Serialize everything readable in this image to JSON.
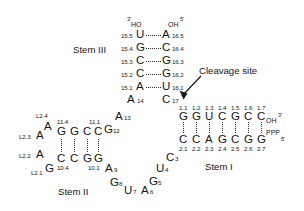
{
  "figure": {
    "type": "rna-secondary-structure",
    "stem_labels": {
      "stem1": "Stem I",
      "stem2": "Stem II",
      "stem3": "Stem III"
    },
    "annotations": {
      "cleavage_site": "Cleavage site"
    },
    "termini": {
      "stem3_left_prime": "3'",
      "stem3_left_group": "HO",
      "stem3_right_group": "OH",
      "stem3_right_prime": "5'",
      "stem1_top_group": "OH",
      "stem1_top_prime": "3'",
      "stem1_bottom_group": "PPP",
      "stem1_bottom_prime": "5'"
    },
    "stem3": {
      "left_strand": [
        {
          "base": "U",
          "number": "15.5"
        },
        {
          "base": "G",
          "number": "15.4"
        },
        {
          "base": "C",
          "number": "15.3"
        },
        {
          "base": "C",
          "number": "15.2"
        },
        {
          "base": "A",
          "number": "15.1"
        }
      ],
      "right_strand": [
        {
          "base": "A",
          "number": "16.5"
        },
        {
          "base": "C",
          "number": "16.4"
        },
        {
          "base": "G",
          "number": "16.3"
        },
        {
          "base": "G",
          "number": "16.2"
        },
        {
          "base": "U",
          "number": "16.1"
        }
      ]
    },
    "stem1": {
      "top_strand": [
        {
          "base": "G",
          "number": "1.1"
        },
        {
          "base": "G",
          "number": "1.2"
        },
        {
          "base": "U",
          "number": "1.3"
        },
        {
          "base": "C",
          "number": "1.4"
        },
        {
          "base": "G",
          "number": "1.5"
        },
        {
          "base": "C",
          "number": "1.6"
        },
        {
          "base": "C",
          "number": "1.7"
        }
      ],
      "bottom_strand": [
        {
          "base": "C",
          "number": "2.1"
        },
        {
          "base": "C",
          "number": "2.2"
        },
        {
          "base": "A",
          "number": "2.3"
        },
        {
          "base": "G",
          "number": "2.4"
        },
        {
          "base": "C",
          "number": "2.5"
        },
        {
          "base": "G",
          "number": "2.6"
        },
        {
          "base": "G",
          "number": "2.7"
        }
      ]
    },
    "stem2": {
      "top_strand": [
        {
          "base": "G",
          "number": "11.4"
        },
        {
          "base": "G",
          "number": ""
        },
        {
          "base": "C",
          "number": ""
        },
        {
          "base": "C",
          "number": "11.1"
        }
      ],
      "bottom_strand": [
        {
          "base": "C",
          "number": "10.4"
        },
        {
          "base": "C",
          "number": ""
        },
        {
          "base": "G",
          "number": ""
        },
        {
          "base": "G",
          "number": "10.1"
        }
      ]
    },
    "loop2": [
      {
        "base": "A",
        "number": "L2.4"
      },
      {
        "base": "A",
        "number": "L2.3"
      },
      {
        "base": "A",
        "number": "L2.2"
      },
      {
        "base": "G",
        "number": "L2.1"
      }
    ],
    "core_bases": [
      {
        "base": "A",
        "number": "14"
      },
      {
        "base": "C",
        "number": "17"
      },
      {
        "base": "A",
        "number": "13"
      },
      {
        "base": "G",
        "number": "12"
      },
      {
        "base": "A",
        "number": "9"
      },
      {
        "base": "G",
        "number": "8"
      },
      {
        "base": "U",
        "number": "7"
      },
      {
        "base": "A",
        "number": "6"
      },
      {
        "base": "G",
        "number": "5"
      },
      {
        "base": "U",
        "number": "4"
      },
      {
        "base": "C",
        "number": "3"
      }
    ],
    "colors": {
      "base_text": "#141414",
      "number_text": "#1c1c1c",
      "hbond": "#2a2a2a",
      "background": "#ffffff"
    }
  }
}
